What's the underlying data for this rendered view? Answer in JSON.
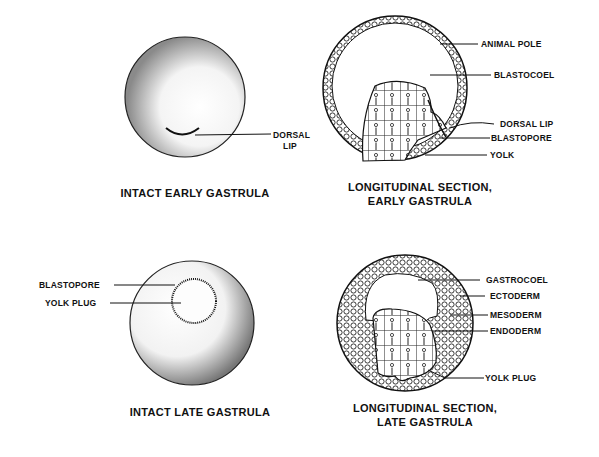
{
  "figures": [
    {
      "id": "intact-early",
      "caption": [
        "INTACT EARLY GASTRULA"
      ],
      "labels": [
        "DORSAL",
        "LIP"
      ]
    },
    {
      "id": "section-early",
      "caption": [
        "LONGITUDINAL SECTION,",
        "EARLY GASTRULA"
      ],
      "labels": [
        "ANIMAL POLE",
        "BLASTOCOEL",
        "DORSAL LIP",
        "BLASTOPORE",
        "YOLK"
      ]
    },
    {
      "id": "intact-late",
      "caption": [
        "INTACT LATE GASTRULA"
      ],
      "labels": [
        "BLASTOPORE",
        "YOLK PLUG"
      ]
    },
    {
      "id": "section-late",
      "caption": [
        "LONGITUDINAL SECTION,",
        "LATE GASTRULA"
      ],
      "labels": [
        "GASTROCOEL",
        "ECTODERM",
        "MESODERM",
        "ENDODERM",
        "YOLK PLUG"
      ]
    }
  ],
  "colors": {
    "ink": "#111111",
    "background": "#ffffff"
  }
}
